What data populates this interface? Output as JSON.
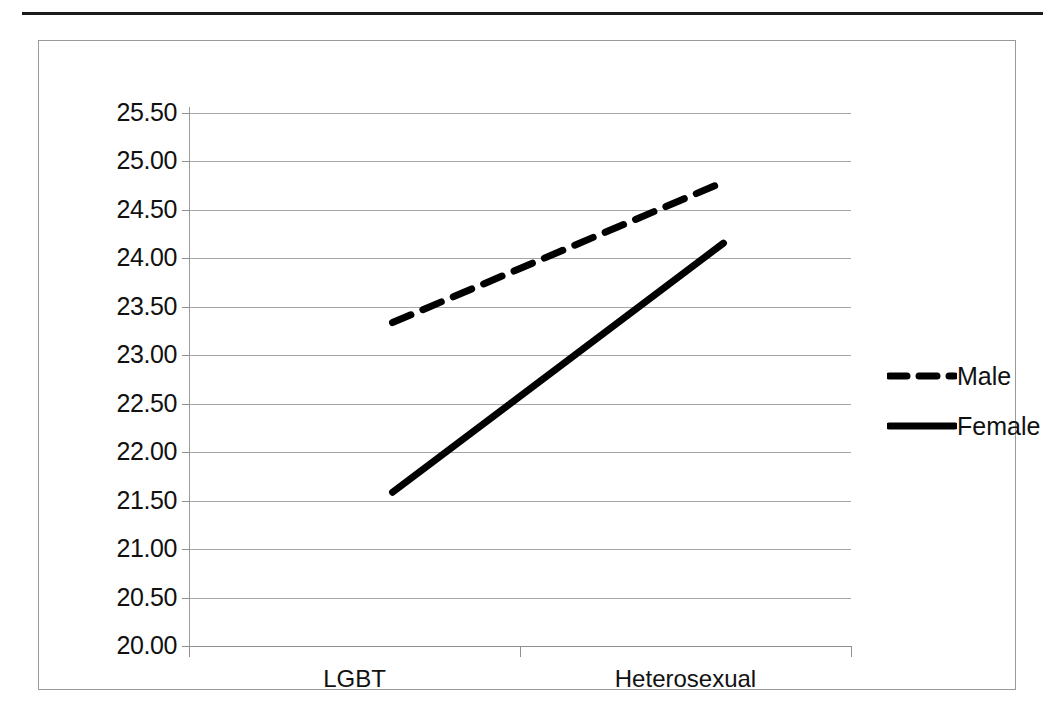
{
  "chart_data": {
    "type": "line",
    "title": "",
    "subtitle": "",
    "xlabel": "",
    "ylabel": "",
    "categories": [
      "LGBT",
      "Heterosexual"
    ],
    "x": [
      0,
      1
    ],
    "series": [
      {
        "name": "Male",
        "values": [
          23.75,
          25.2
        ],
        "style": "dashed"
      },
      {
        "name": "Female",
        "values": [
          22.0,
          24.57
        ],
        "style": "solid"
      }
    ],
    "ylim": [
      20.0,
      25.5
    ],
    "ytick_step": 0.5,
    "ytick_labels": [
      "25.50",
      "25.00",
      "24.50",
      "24.00",
      "23.50",
      "23.00",
      "22.50",
      "22.00",
      "21.50",
      "21.00",
      "20.50",
      "20.00"
    ],
    "ytick_values": [
      25.5,
      25.0,
      24.5,
      24.0,
      23.5,
      23.0,
      22.5,
      22.0,
      21.5,
      21.0,
      20.5,
      20.0
    ],
    "grid": true,
    "grid_axis": "y",
    "legend_position": "right",
    "legend_entries": [
      "Male",
      "Female"
    ],
    "line_color": "#000000",
    "grid_color": "#a6a6a6",
    "axis_color": "#8f8f8f",
    "border_color": "#9a9a9a",
    "background": "#ffffff"
  },
  "legend": {
    "items": [
      {
        "label": "Male",
        "style": "dashed"
      },
      {
        "label": "Female",
        "style": "solid"
      }
    ]
  },
  "axes": {
    "x_categories": [
      "LGBT",
      "Heterosexual"
    ]
  }
}
